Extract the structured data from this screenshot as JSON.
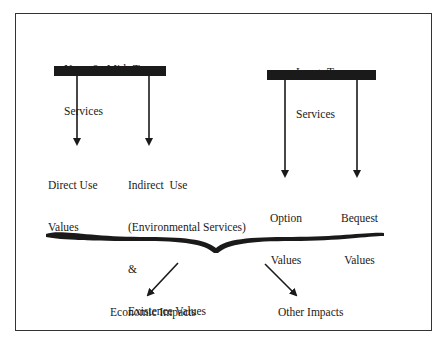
{
  "diagram": {
    "groups": [
      {
        "id": "near-mid-term",
        "title_line1": "Near  &  Mid -Term",
        "title_line2": "Services",
        "children": [
          {
            "id": "direct-use",
            "line1": "Direct Use",
            "line2": "Values"
          },
          {
            "id": "indirect-use",
            "line1": "Indirect  Use",
            "line2": "(Environmental Services)",
            "line3": "&",
            "line4": "Existence Values"
          }
        ]
      },
      {
        "id": "long-term",
        "title_line1": "Long -Term",
        "title_line2": "Services",
        "children": [
          {
            "id": "option",
            "line1": "Option",
            "line2": "Values"
          },
          {
            "id": "bequest",
            "line1": "Bequest",
            "line2": "Values"
          }
        ]
      }
    ],
    "outcomes": [
      {
        "id": "economic",
        "label": "Economic Impacts"
      },
      {
        "id": "other",
        "label": "Other Impacts"
      }
    ],
    "colors": {
      "ink": "#1a1a1a",
      "border": "#333333",
      "background": "#ffffff"
    }
  }
}
